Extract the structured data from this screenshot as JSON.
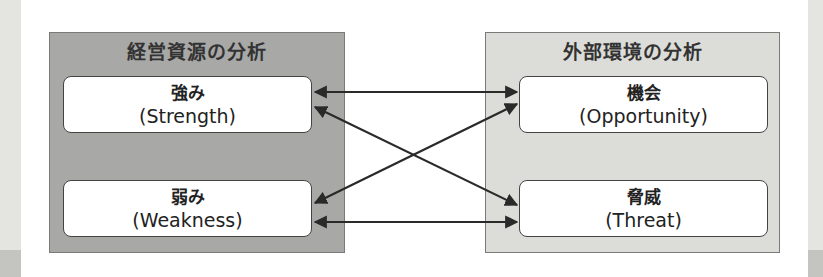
{
  "colors": {
    "internal_panel": "#a8a8a6",
    "external_panel": "#dcdcd8",
    "box_fill": "#ffffff",
    "box_border": "#444444",
    "arrow": "#2a2a2a",
    "side_strip": "#e4e4e0"
  },
  "internal": {
    "title": "経営資源の分析",
    "items": [
      {
        "jp": "強み",
        "en": "(Strength)"
      },
      {
        "jp": "弱み",
        "en": "(Weakness)"
      }
    ]
  },
  "external": {
    "title": "外部環境の分析",
    "items": [
      {
        "jp": "機会",
        "en": "(Opportunity)"
      },
      {
        "jp": "脅威",
        "en": "(Threat)"
      }
    ]
  },
  "connections": [
    {
      "from": "強み",
      "to": "機会",
      "type": "bidirectional"
    },
    {
      "from": "強み",
      "to": "脅威",
      "type": "bidirectional"
    },
    {
      "from": "弱み",
      "to": "機会",
      "type": "bidirectional"
    },
    {
      "from": "弱み",
      "to": "脅威",
      "type": "bidirectional"
    }
  ]
}
